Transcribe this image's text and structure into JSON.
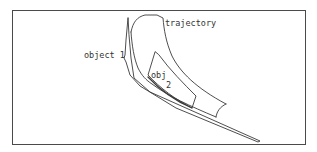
{
  "diagram": {
    "labels": {
      "trajectory": "trajectory",
      "object1": "object 1",
      "obj2_line1": "obj",
      "obj2_line2": "2"
    },
    "colors": {
      "line": "#3a3a3a",
      "frame": "#4a4a4a",
      "text": "#333333",
      "background": "#ffffff"
    }
  }
}
